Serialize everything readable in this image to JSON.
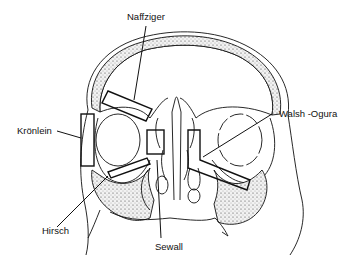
{
  "diagram": {
    "labels": {
      "naffziger": "Naffziger",
      "kronlein": "Krönlein",
      "walsh_ogura": "Walsh -Ogura",
      "hirsch": "Hirsch",
      "sewall": "Sewall"
    },
    "colors": {
      "line": "#111111",
      "bone_fill": "#e8e8e8",
      "background": "#ffffff"
    }
  }
}
